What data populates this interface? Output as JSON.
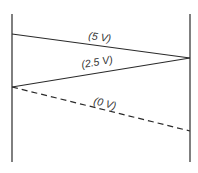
{
  "diagram": {
    "type": "voltage-ladder/bounce diagram",
    "colors": {
      "line": "#2a2a2a",
      "background": "#ffffff"
    },
    "boundaries": [
      {
        "name": "left-boundary",
        "x": 12,
        "y1": 14,
        "y2": 162
      },
      {
        "name": "right-boundary",
        "x": 190,
        "y1": 14,
        "y2": 162
      }
    ],
    "traces": [
      {
        "name": "trace-5v",
        "label": "(5 V)",
        "style": "solid",
        "x1": 12,
        "y1": 34,
        "x2": 190,
        "y2": 58,
        "label_x": 88,
        "label_y": 39,
        "label_rotate": 7.7
      },
      {
        "name": "trace-2-5v",
        "label": "(2.5 V)",
        "style": "solid",
        "x1": 190,
        "y1": 58,
        "x2": 12,
        "y2": 87,
        "label_x": 82,
        "label_y": 68,
        "label_rotate": -9.3
      },
      {
        "name": "trace-0v",
        "label": "(0 V)",
        "style": "dashed",
        "x1": 12,
        "y1": 87,
        "x2": 190,
        "y2": 131,
        "label_x": 93,
        "label_y": 104,
        "label_rotate": 13.9
      }
    ]
  }
}
